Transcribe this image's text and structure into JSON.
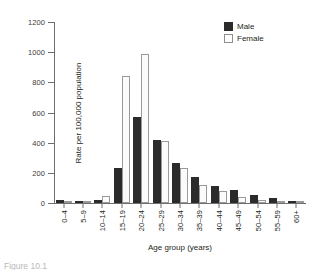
{
  "chart_data": {
    "type": "bar",
    "title": "",
    "xlabel": "Age group (years)",
    "ylabel": "Rate per 100,000 population",
    "ylim": [
      0,
      1200
    ],
    "yticks": [
      0,
      200,
      400,
      600,
      800,
      1000,
      1200
    ],
    "grid": false,
    "legend_position": "top-right",
    "categories": [
      "0–4",
      "5–9",
      "10–14",
      "15–19",
      "20–24",
      "25–29",
      "30–34",
      "35–39",
      "40–44",
      "45–49",
      "50–54",
      "55–59",
      "60+"
    ],
    "series": [
      {
        "name": "Male",
        "color": "#2b2b2b",
        "values": [
          18,
          6,
          22,
          235,
          570,
          415,
          265,
          175,
          115,
          88,
          55,
          30,
          12
        ]
      },
      {
        "name": "Female",
        "color": "#fbfbfb",
        "values": [
          14,
          5,
          48,
          845,
          985,
          410,
          235,
          120,
          78,
          38,
          20,
          10,
          5
        ]
      }
    ]
  },
  "legend": {
    "items": [
      {
        "label": "Male",
        "swatch": "male"
      },
      {
        "label": "Female",
        "swatch": "female"
      }
    ]
  },
  "caption": {
    "text": "Figure 10.1"
  }
}
